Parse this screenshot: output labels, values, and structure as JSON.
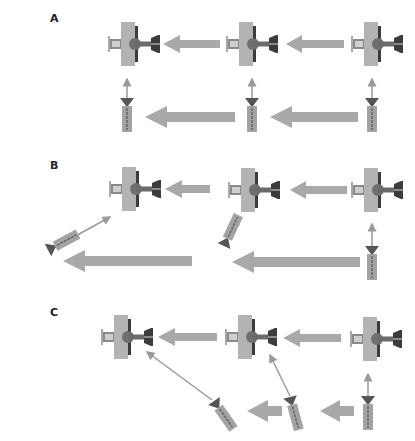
{
  "panels": [
    {
      "label": "A",
      "description": "Sequential ribosome handoff; tool docks vertically into each station"
    },
    {
      "label": "B",
      "description": "Tool tilts leftward, delivering diagonally to the previous station"
    },
    {
      "label": "C",
      "description": "Tool tilts and is handed back along the bottom row before docking"
    }
  ],
  "colors": {
    "arrow_fill": "#a9a9a9",
    "plate_fill": "#b3b3b3",
    "dark_part": "#3c3c3c",
    "mid_part": "#7a7a7a",
    "thin_arrow": "#9a9a9a",
    "background": "#ffffff"
  },
  "legend": {
    "big_arrow": "Direction of transfer between stations",
    "thin_arrow": "Docking / delivery path",
    "station": "Fixture (plate + shaft + knob)",
    "tool": "Cartridge with conical head"
  }
}
